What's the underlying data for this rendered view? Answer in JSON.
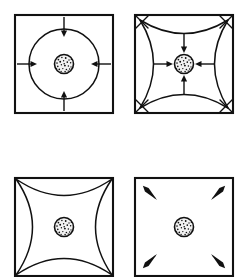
{
  "figure": {
    "background_color": "#ffffff",
    "line_color": "#111111",
    "width": 248,
    "height": 277,
    "panel_count": 4,
    "layout": "2x2 grid"
  },
  "panels": [
    {
      "id": "panel-top-left",
      "position": "top-left",
      "label": "square with inscribed circle and four inward arrows",
      "square": {
        "x": 15,
        "y": 15,
        "size": 98
      },
      "center": {
        "x": 64,
        "y": 64
      },
      "core_radius": 9.5,
      "shapes": [
        {
          "kind": "square",
          "stroke": "#111111"
        },
        {
          "kind": "circle",
          "radius": 35,
          "stroke": "#111111"
        },
        {
          "kind": "stippled-core",
          "radius": 9.5
        }
      ],
      "arrows": {
        "count": 4,
        "direction": "inward",
        "orientation": "axial",
        "headings": [
          "north",
          "east",
          "south",
          "west"
        ]
      },
      "corner_marks": "none"
    },
    {
      "id": "panel-top-right",
      "position": "top-right",
      "label": "square with concave pillow curves, corner crosses and four inward arrows",
      "square": {
        "x": 135,
        "y": 15,
        "size": 98
      },
      "center": {
        "x": 184,
        "y": 64
      },
      "core_radius": 9.5,
      "shapes": [
        {
          "kind": "square",
          "stroke": "#111111"
        },
        {
          "kind": "pillow-concave",
          "stroke": "#111111"
        },
        {
          "kind": "stippled-core",
          "radius": 9.5
        }
      ],
      "arrows": {
        "count": 4,
        "direction": "inward",
        "orientation": "axial",
        "headings": [
          "north",
          "east",
          "south",
          "west"
        ]
      },
      "corner_marks": "x-cross"
    },
    {
      "id": "panel-bottom-left",
      "position": "bottom-left",
      "label": "square with astroid four-point star, no arrows",
      "square": {
        "x": 15,
        "y": 178,
        "size": 98
      },
      "center": {
        "x": 64,
        "y": 227
      },
      "core_radius": 9.5,
      "shapes": [
        {
          "kind": "square",
          "stroke": "#111111"
        },
        {
          "kind": "astroid-star",
          "stroke": "#111111"
        },
        {
          "kind": "stippled-core",
          "radius": 9.5
        }
      ],
      "arrows": {
        "count": 0,
        "direction": "none",
        "orientation": "none",
        "headings": []
      },
      "corner_marks": "none"
    },
    {
      "id": "panel-bottom-right",
      "position": "bottom-right",
      "label": "plain square with four diagonal arrows pointing outward to corners",
      "square": {
        "x": 135,
        "y": 178,
        "size": 98
      },
      "center": {
        "x": 184,
        "y": 227
      },
      "core_radius": 9.5,
      "shapes": [
        {
          "kind": "square",
          "stroke": "#111111"
        },
        {
          "kind": "stippled-core",
          "radius": 9.5
        }
      ],
      "arrows": {
        "count": 4,
        "direction": "outward",
        "orientation": "diagonal",
        "headings": [
          "northwest",
          "northeast",
          "southwest",
          "southeast"
        ]
      },
      "corner_marks": "none"
    }
  ]
}
